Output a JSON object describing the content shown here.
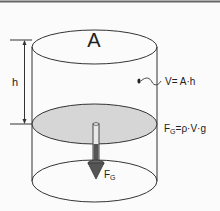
{
  "diagram": {
    "labels": {
      "area": "A",
      "height": "h",
      "volume_formula": "V= A·h",
      "force_formula_main": "F",
      "force_formula_sub": "G",
      "force_formula_rest": "=ρ·V·g",
      "force_arrow_main": "F",
      "force_arrow_sub": "G"
    },
    "colors": {
      "stroke": "#333333",
      "fluid_surface": "#d6d6d6",
      "arrow": "#555555",
      "background": "#fbfbfb",
      "border": "#666666"
    },
    "elements": [
      {
        "id": "cylinder",
        "description": "open cylinder outline with top and bottom ellipses"
      },
      {
        "id": "fluid-surface",
        "description": "grey shaded horizontal cross-section ellipse"
      },
      {
        "id": "height-dimension",
        "description": "vertical dimension line labeled h"
      },
      {
        "id": "volume-pointer",
        "description": "dot with squiggle pointing to V= A·h"
      },
      {
        "id": "weight-arrow",
        "description": "downward arrow labeled F_G"
      }
    ]
  }
}
